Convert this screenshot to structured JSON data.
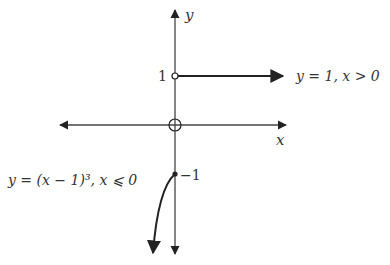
{
  "diagram": {
    "axes": {
      "x_label": "x",
      "y_label": "y",
      "origin_marker": "open-circle-with-cross"
    },
    "ticks": {
      "y_one": "1",
      "y_neg_one": "−1"
    },
    "pieces": [
      {
        "label": "y = 1,  x > 0",
        "description": "horizontal ray at y=1 starting with open circle at (0,1), arrow to the right"
      },
      {
        "label": "y = (x − 1)³,  x ⩽ 0",
        "description": "cubic curve ending at closed dot (0,-1), arrow downward to the left"
      }
    ],
    "colors": {
      "stroke": "#222222",
      "text": "#333333"
    }
  }
}
